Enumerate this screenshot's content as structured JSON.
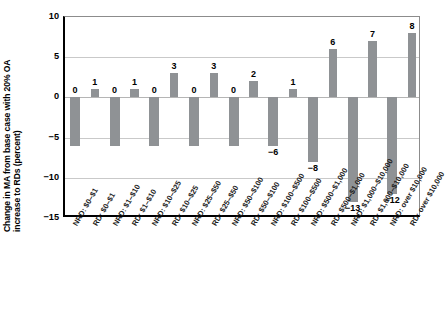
{
  "chart_data": {
    "type": "bar",
    "title": "",
    "xlabel": "",
    "ylabel": "Change in MA from base case with 20% OA increase to RDs (percent)",
    "ylabel_lines": [
      "Change in MA from base case with 20% OA",
      "increase to RDs (percent)"
    ],
    "ylim": [
      -15,
      10
    ],
    "yticks": [
      10,
      5,
      0,
      -5,
      -10,
      -15
    ],
    "ytick_labels": [
      "10",
      "5",
      "0",
      "−5",
      "−10",
      "−15"
    ],
    "grid": true,
    "legend": "none",
    "bar_color": "#8f9295",
    "categories": [
      "NRD: $0–$1",
      "RD: $0–$1",
      "NRD: $1–$10",
      "RD: $1–$10",
      "NRD: $10–$25",
      "RD: $10–$25",
      "NRD: $25–$50",
      "RD: $25–$50",
      "NRD: $50–$100",
      "RD: $50–$100",
      "NRD: $100–$500",
      "RD: $100–$500",
      "NRD: $500–$1,000",
      "RD: $500–$1,000",
      "NRD: $1,000–$10,000",
      "RD: $1,000–$10,000",
      "NRD: over $10,000",
      "RD: over $10,000"
    ],
    "values": [
      -6,
      1,
      -6,
      1,
      -6,
      3,
      -6,
      3,
      -6,
      2,
      -6,
      1,
      -8,
      6,
      -13,
      7,
      -12,
      8
    ],
    "data_labels": [
      "0",
      "1",
      "0",
      "1",
      "0",
      "3",
      "0",
      "3",
      "0",
      "2",
      "−6",
      "1",
      "−8",
      "6",
      "−13",
      "7",
      "−12",
      "8"
    ],
    "label_positions": [
      "above-zero",
      "above-bar",
      "above-zero",
      "above-bar",
      "above-zero",
      "above-bar",
      "above-zero",
      "above-bar",
      "above-zero",
      "above-bar",
      "below-bar",
      "above-bar",
      "below-bar",
      "above-bar",
      "below-bar",
      "above-bar",
      "below-bar",
      "above-bar"
    ]
  }
}
